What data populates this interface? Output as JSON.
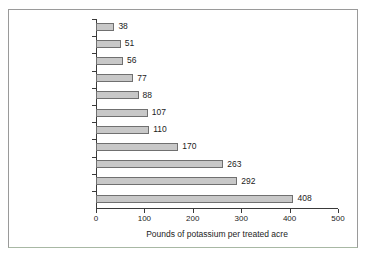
{
  "chart_data": {
    "type": "bar",
    "orientation": "horizontal",
    "title": "",
    "xlabel": "Pounds of potassium per treated acre",
    "ylabel": "",
    "xlim": [
      0,
      500
    ],
    "xticks": [
      0,
      100,
      200,
      300,
      400,
      500
    ],
    "xtick_labels": [
      "0",
      "100",
      "200",
      "300",
      "400",
      "500"
    ],
    "grid": false,
    "legend": false,
    "categories": [
      "Wheat",
      "Cotton",
      "Corn",
      "Lettuce (head)",
      "Soybeans",
      "Grapes",
      "Carrots",
      "Potatoes",
      "Bell peppers",
      "Celery",
      "Tomatoes (fresh)"
    ],
    "values": [
      38,
      51,
      56,
      77,
      88,
      107,
      110,
      170,
      263,
      292,
      408
    ],
    "value_labels": [
      "38",
      "51",
      "56",
      "77",
      "88",
      "107",
      "110",
      "170",
      "263",
      "292",
      "408"
    ],
    "bar_color": "#c8c8c8",
    "bar_edge_color": "#707070",
    "axis_color": "#3a3a3a",
    "text_color": "#1c1c1c",
    "frame_color": "#9a9a9a",
    "background": "#ffffff"
  }
}
